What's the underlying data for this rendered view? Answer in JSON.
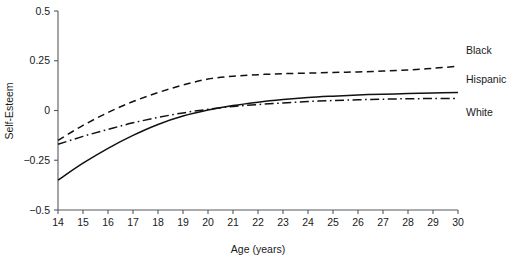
{
  "chart_data": {
    "type": "line",
    "title": "",
    "xlabel": "Age (years)",
    "ylabel": "Self-Esteem",
    "xlim": [
      14,
      30
    ],
    "ylim": [
      -0.5,
      0.5
    ],
    "grid": false,
    "legend_position": "right-inline",
    "xticks": [
      14,
      15,
      16,
      17,
      18,
      19,
      20,
      21,
      22,
      23,
      24,
      25,
      26,
      27,
      28,
      29,
      30
    ],
    "xtick_labels": [
      "14",
      "15",
      "16",
      "17",
      "18",
      "19",
      "20",
      "21",
      "22",
      "23",
      "24",
      "25",
      "26",
      "27",
      "28",
      "29",
      "30"
    ],
    "yticks": [
      -0.5,
      -0.25,
      0,
      0.25,
      0.5
    ],
    "ytick_labels": [
      "−0.5",
      "−0.25",
      "0",
      "0.25",
      "0.5"
    ],
    "x": [
      14,
      15,
      16,
      17,
      18,
      19,
      20,
      21,
      22,
      23,
      24,
      25,
      26,
      27,
      28,
      29,
      30
    ],
    "series": [
      {
        "name": "Black",
        "style": "dashed",
        "label": "Black",
        "values": [
          -0.15,
          -0.075,
          -0.01,
          0.045,
          0.09,
          0.128,
          0.158,
          0.172,
          0.18,
          0.185,
          0.188,
          0.191,
          0.194,
          0.198,
          0.204,
          0.212,
          0.222
        ]
      },
      {
        "name": "Hispanic",
        "style": "solid",
        "label": "Hispanic",
        "values": [
          -0.35,
          -0.265,
          -0.19,
          -0.125,
          -0.07,
          -0.028,
          0.002,
          0.025,
          0.042,
          0.055,
          0.065,
          0.072,
          0.078,
          0.082,
          0.085,
          0.088,
          0.09
        ]
      },
      {
        "name": "White",
        "style": "dash-dot",
        "label": "White",
        "values": [
          -0.17,
          -0.13,
          -0.095,
          -0.062,
          -0.035,
          -0.012,
          0.006,
          0.02,
          0.03,
          0.038,
          0.045,
          0.05,
          0.054,
          0.057,
          0.059,
          0.06,
          0.06
        ]
      }
    ]
  }
}
